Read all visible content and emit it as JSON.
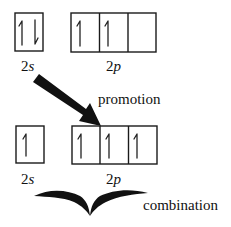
{
  "diagram": {
    "type": "orbital-diagram",
    "colors": {
      "ink": "#1a1a1a",
      "background": "#ffffff"
    },
    "top_row": {
      "state": "ground",
      "orbitals": [
        {
          "label_num": "2",
          "label_sub": "s",
          "boxes": [
            {
              "electrons": [
                "up",
                "down"
              ]
            }
          ]
        },
        {
          "label_num": "2",
          "label_sub": "p",
          "boxes": [
            {
              "electrons": [
                "up"
              ]
            },
            {
              "electrons": [
                "up"
              ]
            },
            {
              "electrons": []
            }
          ]
        }
      ]
    },
    "arrow": {
      "label": "promotion",
      "from": "2s",
      "to": "2p"
    },
    "bottom_row": {
      "state": "excited",
      "orbitals": [
        {
          "label_num": "2",
          "label_sub": "s",
          "boxes": [
            {
              "electrons": [
                "up"
              ]
            }
          ]
        },
        {
          "label_num": "2",
          "label_sub": "p",
          "boxes": [
            {
              "electrons": [
                "up"
              ]
            },
            {
              "electrons": [
                "up"
              ]
            },
            {
              "electrons": [
                "up"
              ]
            }
          ]
        }
      ]
    },
    "brace": {
      "label": "combination"
    }
  }
}
